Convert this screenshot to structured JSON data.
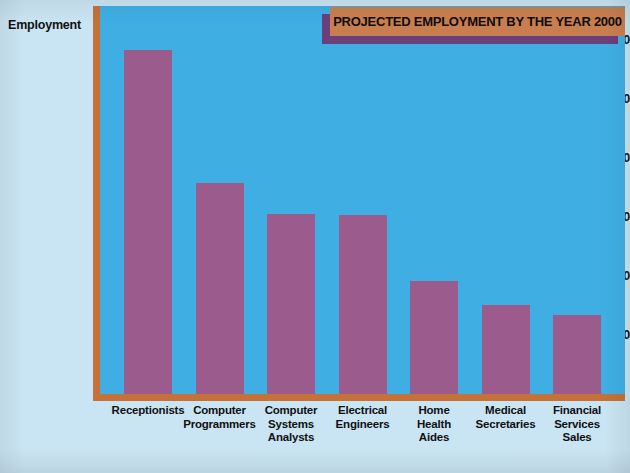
{
  "poster": {
    "title": "PROJECTED EMPLOYMENT BY THE YEAR 2000",
    "background_color": "#c9e4f2",
    "plot_background_color": "#3faee3",
    "bar_color": "#9b5b8c",
    "axis_color": "#c4713a",
    "banner_color": "#c97e4f",
    "banner_shadow_color": "#6b3f7a"
  },
  "chart_data": {
    "type": "bar",
    "title": "PROJECTED EMPLOYMENT BY THE YEAR 2000",
    "xlabel": "",
    "ylabel": "Employment",
    "categories": [
      "Receptionists",
      "Computer Programmers",
      "Computer Systems Analysts",
      "Electrical Engineers",
      "Home Health Aides",
      "Medical Secretaries",
      "Financial Services Sales"
    ],
    "category_lines": [
      [
        "Receptionists"
      ],
      [
        "Computer",
        "Programmers"
      ],
      [
        "Computer",
        "Systems",
        "Analysts"
      ],
      [
        "Electrical",
        "Engineers"
      ],
      [
        "Home",
        "Health",
        "Aides"
      ],
      [
        "Medical",
        "Secretaries"
      ],
      [
        "Financial",
        "Services",
        "Sales"
      ]
    ],
    "values": [
      1170000,
      720000,
      615000,
      610000,
      385000,
      305000,
      270000
    ],
    "ylim": [
      0,
      1330000
    ],
    "yticks": [
      200000,
      400000,
      600000,
      800000,
      1000000,
      1200000
    ],
    "ytick_labels": [
      "200,000",
      "400,000",
      "600,000",
      "800,000",
      "1,000,000",
      "1,200,000"
    ],
    "grid": false,
    "legend": null
  }
}
